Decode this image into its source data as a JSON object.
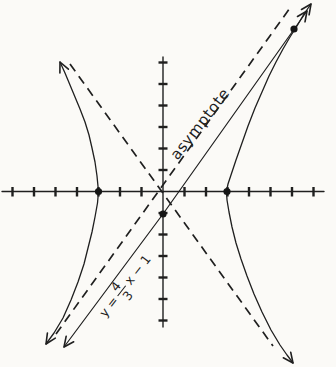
{
  "figure": {
    "kind": "hyperbola graph with asymptotes and a parallel secant line",
    "background_color": "#fbfaf7",
    "ink_color": "#1f1f1f",
    "labels": {
      "asymptote": "asymptote",
      "equation": {
        "prefix": "y =",
        "fraction_numerator": "4",
        "fraction_denominator": "3",
        "suffix": "x − 1"
      }
    },
    "axes": {
      "x_tick_count": 14,
      "y_tick_count": 12,
      "tick_labels_shown": false
    }
  },
  "chart_data": {
    "type": "line",
    "title": "",
    "xlabel": "",
    "ylabel": "",
    "x_tick_range": [
      -7,
      7
    ],
    "y_tick_range": [
      -6,
      6
    ],
    "grid": false,
    "curves": [
      {
        "name": "hyperbola (two branches, opens left-right)",
        "style": "solid",
        "vertices": [
          [
            -3,
            0
          ],
          [
            3,
            0
          ]
        ]
      },
      {
        "name": "asymptote (labeled)",
        "equation_label": "asymptote",
        "slope": 1.3333,
        "intercept": 0,
        "style": "dashed"
      },
      {
        "name": "asymptote (unlabeled)",
        "slope": -1.3333,
        "intercept": 0,
        "style": "dashed"
      },
      {
        "name": "line",
        "equation_label": "y = 4/3 x − 1",
        "slope": 1.3333,
        "intercept": -1,
        "style": "solid"
      }
    ],
    "marked_points": [
      {
        "point": [
          -3,
          0
        ],
        "meaning": "left vertex"
      },
      {
        "point": [
          3,
          0
        ],
        "meaning": "right vertex"
      },
      {
        "point": [
          0,
          -1
        ],
        "meaning": "y-intercept of line"
      },
      {
        "point": [
          6.4,
          7.5
        ],
        "meaning": "intersection of line and hyperbola"
      }
    ],
    "legend_position": "none"
  }
}
